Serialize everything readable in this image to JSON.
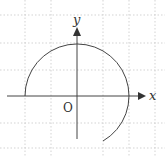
{
  "diagram": {
    "axes": {
      "x_label": "x",
      "y_label": "y",
      "origin_label": "O"
    },
    "grid": {
      "style": "dotted",
      "spacing_px": 26,
      "color": "#c8c8c8"
    },
    "curve": {
      "type": "arc",
      "center": [
        0,
        0
      ],
      "radius_units": 2,
      "start_angle_deg": 180,
      "end_angle_deg": -60,
      "color": "#444444"
    },
    "colors": {
      "axis": "#444444",
      "background": "#ffffff"
    }
  }
}
